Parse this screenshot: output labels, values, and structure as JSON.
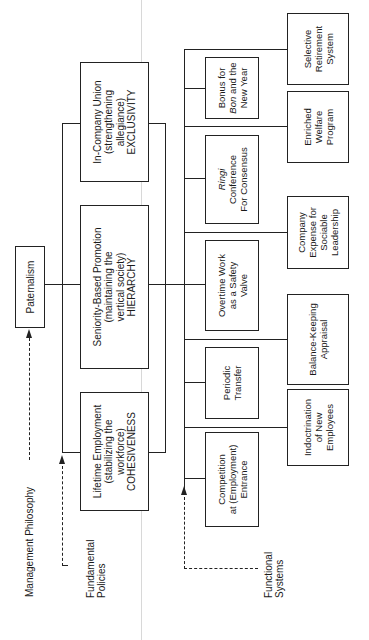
{
  "philosophy": {
    "label": "Management Philosophy",
    "box": "Paternalism"
  },
  "fundamental_policies": {
    "label": "Fundamental Policies",
    "items": [
      {
        "text": "In-Company Union\n(strengthening\nallegiance)\nEXCLUSIVITY"
      },
      {
        "text": "Seniority-Based Promotion\n(maintaining the\nvertical society)\nHIERARCHY"
      },
      {
        "text": "Lifetime Employment\n(stabilizing the\nworkforce)\nCOHESIVENESS"
      }
    ]
  },
  "functional_systems": {
    "label": "Functional Systems",
    "inner_column": [
      {
        "italic": "Bon",
        "pre": "Bonus for\n",
        "post": " and the\nNew Year"
      },
      {
        "italic": "Ringi",
        "pre": "",
        "post": "\nConference\nFor Consensus"
      },
      {
        "text": "Overtime Work\nas a Safety\nValve"
      },
      {
        "text": "Periodic\nTransfer"
      },
      {
        "text": "Competition\nat (Employment)\nEntrance"
      }
    ],
    "outer_column": [
      {
        "text": "Selective\nRetirement\nSystem"
      },
      {
        "text": "Enriched\nWelfare\nProgram"
      },
      {
        "text": "Company\nExpense for\nSociable\nLeadership"
      },
      {
        "text": "Balance-Keeping\nAppraisal"
      },
      {
        "text": "Indoctrination\nof New\nEmployees"
      }
    ]
  }
}
